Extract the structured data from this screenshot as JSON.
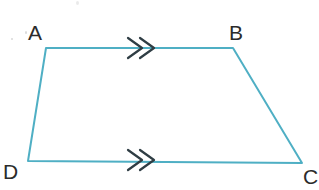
{
  "figure": {
    "kind": "geometry-diagram",
    "shape_name": "trapezium ABCD",
    "width": 319,
    "height": 190,
    "background_color": "#ffffff",
    "stroke_color": "#4FAFC4",
    "stroke_width": 2,
    "label_color": "#2b2b2b",
    "tick_color": "#2f3d44",
    "vertices": [
      {
        "name": "A",
        "label": "A",
        "x": 46,
        "y": 48,
        "label_x": 28,
        "label_y": 22
      },
      {
        "name": "B",
        "label": "B",
        "x": 233,
        "y": 48,
        "label_x": 229,
        "label_y": 22
      },
      {
        "name": "C",
        "label": "C",
        "x": 302,
        "y": 163,
        "label_x": 303,
        "label_y": 166
      },
      {
        "name": "D",
        "label": "D",
        "x": 28,
        "y": 161,
        "label_x": 3,
        "label_y": 161
      }
    ],
    "sides": [
      {
        "name": "AB",
        "from": "A",
        "to": "B",
        "marks": 2,
        "mark_style": "chevron-arrow",
        "parallel": true
      },
      {
        "name": "BC",
        "from": "B",
        "to": "C",
        "marks": 0,
        "mark_style": "none",
        "parallel": false
      },
      {
        "name": "DC",
        "from": "D",
        "to": "C",
        "marks": 2,
        "mark_style": "chevron-arrow",
        "parallel": true
      },
      {
        "name": "AD",
        "from": "A",
        "to": "D",
        "marks": 0,
        "mark_style": "none",
        "parallel": false
      }
    ],
    "parallel_marker": {
      "glyph": "double-chevron",
      "count": 2,
      "top_center_x": 142,
      "top_center_y": 48,
      "bottom_center_x": 142,
      "bottom_center_y": 160
    },
    "path_d": "M 46 48 L 233 48 L 302 163 L 28 161 Z"
  }
}
